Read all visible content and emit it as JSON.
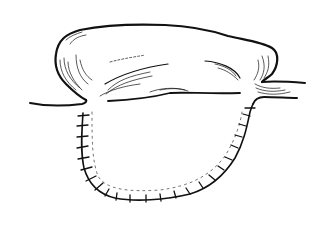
{
  "figure": {
    "colors": {
      "ink": "#111111",
      "background": "#ffffff"
    },
    "stitch_count_left": 8,
    "stitch_count_bottom": 8,
    "stitch_count_right": 9
  }
}
